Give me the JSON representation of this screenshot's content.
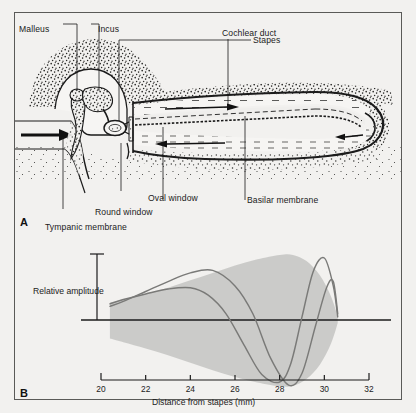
{
  "figure": {
    "panel_a": {
      "letter": "A",
      "labels": {
        "malleus": "Malleus",
        "incus": "Incus",
        "stapes": "Stapes",
        "cochlear_duct": "Cochlear duct",
        "oval_window": "Oval window",
        "round_window": "Round window",
        "tympanic_membrane": "Tympanic membrane",
        "basilar_membrane": "Basilar membrane"
      }
    },
    "panel_b": {
      "letter": "B",
      "y_axis_label": "Relative amplitude",
      "x_axis_label": "Distance from stapes (mm)"
    }
  },
  "colors": {
    "ink": "#1b1b1b",
    "frame": "#5a5a58",
    "paper": "#f2f1ef",
    "envelope_fill": "#c8c8c6",
    "wave_stroke": "#7a7a78",
    "stipple": "#2a2a28"
  },
  "chart_data": {
    "type": "line",
    "title": "",
    "xlabel": "Distance from stapes (mm)",
    "ylabel": "Relative amplitude",
    "xlim": [
      20,
      32
    ],
    "ylim": [
      -1.15,
      1.15
    ],
    "xticks": [
      20,
      22,
      24,
      26,
      28,
      30,
      32
    ],
    "xtick_labels": [
      "20",
      "22",
      "24",
      "26",
      "28",
      "30",
      "32"
    ],
    "yticks": [],
    "grid": false,
    "legend": false,
    "zero_line": true,
    "envelope": {
      "name": "Wave envelope",
      "x": [
        20.4,
        21.0,
        22.0,
        23.0,
        24.0,
        25.0,
        26.0,
        27.0,
        28.0,
        28.6,
        29.2,
        29.8,
        30.3,
        30.6
      ],
      "upper": [
        0.28,
        0.33,
        0.42,
        0.52,
        0.64,
        0.76,
        0.88,
        0.98,
        1.05,
        1.05,
        0.95,
        0.72,
        0.38,
        0.05
      ],
      "lower": [
        -0.3,
        -0.36,
        -0.46,
        -0.57,
        -0.69,
        -0.81,
        -0.92,
        -1.01,
        -1.07,
        -1.06,
        -0.95,
        -0.72,
        -0.38,
        -0.05
      ]
    },
    "series": [
      {
        "name": "Traveling wave (instant 1)",
        "x": [
          20.4,
          21.0,
          22.0,
          23.0,
          24.0,
          24.8,
          25.6,
          26.4,
          27.2,
          28.0,
          28.5,
          29.0,
          29.5,
          30.0,
          30.4,
          30.6
        ],
        "values": [
          0.26,
          0.33,
          0.42,
          0.5,
          0.52,
          0.4,
          0.1,
          -0.4,
          -0.88,
          -1.0,
          -0.7,
          0.05,
          0.78,
          1.0,
          0.55,
          0.05
        ]
      },
      {
        "name": "Traveling wave (instant 2)",
        "x": [
          20.4,
          21.0,
          22.0,
          23.0,
          24.0,
          25.0,
          26.0,
          26.8,
          27.6,
          28.4,
          29.0,
          29.6,
          30.1,
          30.4,
          30.6
        ],
        "values": [
          0.22,
          0.3,
          0.46,
          0.62,
          0.76,
          0.8,
          0.55,
          0.1,
          -0.62,
          -1.05,
          -0.86,
          -0.1,
          0.52,
          0.62,
          0.1
        ]
      }
    ]
  }
}
